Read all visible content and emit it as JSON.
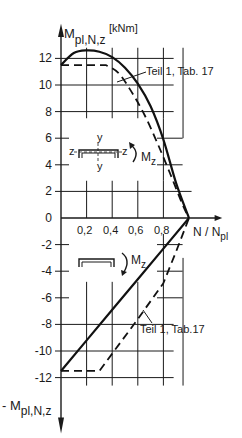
{
  "chart_data": {
    "type": "line",
    "title": "",
    "ylabel_top": "M",
    "ylabel_top_sub": "pl,N,z",
    "yunit": "[kNm]",
    "ylabel_bottom": "- M",
    "ylabel_bottom_sub": "pl,N,z",
    "xlabel": "N / N",
    "xlabel_sub": "pl",
    "xlim": [
      0,
      1.0
    ],
    "ylim": [
      -12,
      12
    ],
    "x_ticks": [
      "0,2",
      "0,4",
      "0,6",
      "0,8"
    ],
    "y_ticks": [
      "12",
      "10",
      "8",
      "6",
      "4",
      "2",
      "0",
      "-2",
      "-4",
      "-6",
      "-8",
      "-10",
      "-12"
    ],
    "grid": true,
    "annotations": {
      "upper_reference": "Teil 1, Tab. 17",
      "lower_reference": "Teil 1, Tab.17",
      "moment_upper": "M",
      "moment_upper_sub": "z",
      "moment_lower": "M",
      "moment_lower_sub": "z",
      "axis_y_top": "y",
      "axis_y_bottom": "y",
      "axis_z_left": "z",
      "axis_z_right": "z"
    },
    "series": [
      {
        "name": "Positive M_z (exact, solid)",
        "style": "solid",
        "x": [
          0.0,
          0.1,
          0.2,
          0.3,
          0.4,
          0.5,
          0.6,
          0.7,
          0.8,
          0.9,
          1.0
        ],
        "y": [
          11.5,
          12.4,
          12.6,
          12.5,
          12.1,
          11.3,
          10.1,
          8.4,
          5.9,
          2.6,
          0.0
        ]
      },
      {
        "name": "Positive M_z (Teil 1, Tab. 17, dashed)",
        "style": "dashed",
        "x": [
          0.0,
          0.35,
          0.45,
          0.55,
          0.65,
          0.75,
          0.85,
          0.95,
          1.0
        ],
        "y": [
          11.5,
          11.5,
          10.9,
          9.5,
          7.8,
          5.7,
          3.4,
          1.0,
          0.0
        ]
      },
      {
        "name": "Negative M_z (exact, solid)",
        "style": "solid",
        "x": [
          0.0,
          0.2,
          0.4,
          0.6,
          0.8,
          1.0
        ],
        "y": [
          -11.5,
          -9.2,
          -6.9,
          -4.6,
          -2.3,
          0.0
        ]
      },
      {
        "name": "Negative M_z (Teil 1, Tab. 17, dashed)",
        "style": "dashed",
        "x": [
          0.0,
          0.3,
          0.4,
          0.6,
          0.8,
          0.9,
          1.0
        ],
        "y": [
          -11.5,
          -11.5,
          -10.2,
          -7.6,
          -4.9,
          -2.5,
          0.0
        ]
      }
    ]
  }
}
